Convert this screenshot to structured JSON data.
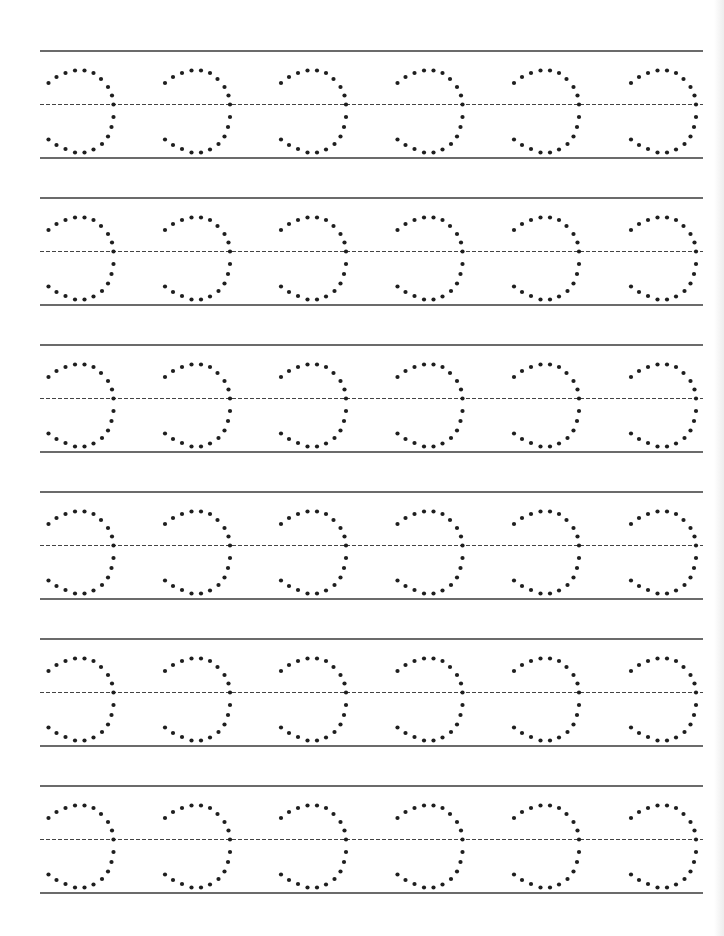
{
  "worksheet": {
    "type": "letter-tracing",
    "letter": "c",
    "rows": 6,
    "glyphs_per_row": 6,
    "colors": {
      "background": "#ffffff",
      "solid_line": "#3a3a3a",
      "dashed_line": "#444444",
      "dot": "#1e1e1e"
    },
    "layout": {
      "line_x_start": 40,
      "line_x_end": 703,
      "row_top_y": [
        51,
        198,
        345,
        492,
        639,
        786
      ],
      "row_height": 107,
      "midline_offset": 53.5,
      "glyph_x": [
        48.5,
        165,
        281,
        397.5,
        514,
        631
      ],
      "dot_radius": 2.1,
      "dash_pattern": "4,2"
    },
    "glyph_dots": [
      [
        0,
        32
      ],
      [
        8,
        26
      ],
      [
        17,
        22
      ],
      [
        26.5,
        19.5
      ],
      [
        36,
        19.5
      ],
      [
        45,
        22
      ],
      [
        52.5,
        28
      ],
      [
        59.5,
        36
      ],
      [
        63.5,
        44.5
      ],
      [
        65,
        53.5
      ],
      [
        65,
        66
      ],
      [
        63,
        76
      ],
      [
        59.5,
        85.5
      ],
      [
        53.5,
        93
      ],
      [
        45,
        98.5
      ],
      [
        36,
        101.5
      ],
      [
        26.5,
        101.5
      ],
      [
        17,
        98
      ],
      [
        8,
        94
      ],
      [
        0,
        88.5
      ]
    ]
  }
}
